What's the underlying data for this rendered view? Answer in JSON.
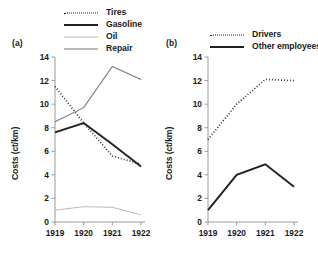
{
  "panels": {
    "a": {
      "tag": "(a)",
      "legend": [
        {
          "label": "Tires",
          "style": "dotted",
          "color": "#231f20"
        },
        {
          "label": "Gasoline",
          "style": "thick",
          "color": "#231f20"
        },
        {
          "label": "Oil",
          "style": "light",
          "color": "#b9b9b9"
        },
        {
          "label": "Repair",
          "style": "medium",
          "color": "#7a7a7a"
        }
      ],
      "ylabel": "Costs (ct/km)"
    },
    "b": {
      "tag": "(b)",
      "legend": [
        {
          "label": "Drivers",
          "style": "dotted",
          "color": "#231f20"
        },
        {
          "label": "Other employees",
          "style": "thick",
          "color": "#231f20"
        }
      ],
      "ylabel": "Costs (ct/km)"
    }
  },
  "chart_data": [
    {
      "type": "line",
      "title": "(a)",
      "xlabel": "",
      "ylabel": "Costs (ct/km)",
      "categories": [
        "1919",
        "1920",
        "1921",
        "1922"
      ],
      "x": [
        1919,
        1920,
        1921,
        1922
      ],
      "ylim": [
        0,
        14
      ],
      "yticks": [
        0,
        2,
        4,
        6,
        8,
        10,
        12,
        14
      ],
      "grid": false,
      "legend_position": "top",
      "series": [
        {
          "name": "Tires",
          "values": [
            11.5,
            8.4,
            5.6,
            4.9
          ],
          "style": "dotted",
          "color": "#231f20"
        },
        {
          "name": "Gasoline",
          "values": [
            7.6,
            8.4,
            6.6,
            4.7
          ],
          "style": "thick",
          "color": "#231f20"
        },
        {
          "name": "Oil",
          "values": [
            1.0,
            1.3,
            1.25,
            0.6
          ],
          "style": "light",
          "color": "#b9b9b9"
        },
        {
          "name": "Repair",
          "values": [
            8.5,
            9.7,
            13.2,
            12.1
          ],
          "style": "medium",
          "color": "#7a7a7a"
        }
      ]
    },
    {
      "type": "line",
      "title": "(b)",
      "xlabel": "",
      "ylabel": "Costs (ct/km)",
      "categories": [
        "1919",
        "1920",
        "1921",
        "1922"
      ],
      "x": [
        1919,
        1920,
        1921,
        1922
      ],
      "ylim": [
        0,
        14
      ],
      "yticks": [
        0,
        2,
        4,
        6,
        8,
        10,
        12,
        14
      ],
      "grid": false,
      "legend_position": "top",
      "series": [
        {
          "name": "Drivers",
          "values": [
            7.0,
            10.0,
            12.1,
            12.0
          ],
          "style": "dotted",
          "color": "#231f20"
        },
        {
          "name": "Other employees",
          "values": [
            1.0,
            4.0,
            4.9,
            3.0
          ],
          "style": "thick",
          "color": "#231f20"
        }
      ]
    }
  ]
}
